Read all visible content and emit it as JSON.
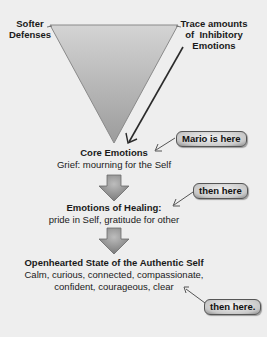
{
  "diagram": {
    "triangle": {
      "left_label": [
        "Softer",
        "Defenses"
      ],
      "right_label": [
        "Trace amounts",
        "of  Inhibitory",
        "Emotions"
      ]
    },
    "stages": [
      {
        "title": "Core Emotions",
        "lines": [
          "Grief: mourning for the Self"
        ],
        "callout": "Mario is here"
      },
      {
        "title": "Emotions of Healing:",
        "lines": [
          "pride in Self, gratitude for other"
        ],
        "callout": "then here"
      },
      {
        "title": "Openhearted State of the Authentic Self",
        "lines": [
          "Calm, curious, connected, compassionate,",
          "confident, courageous, clear"
        ],
        "callout": "then here."
      }
    ],
    "colors": {
      "background": "#eeeeee",
      "triangle_fill_top": "#d0d0d0",
      "triangle_fill_bottom": "#9a9a9a",
      "arrow_fill": "#8c8c8c",
      "line": "#333333",
      "text": "#1a1a1a"
    }
  }
}
